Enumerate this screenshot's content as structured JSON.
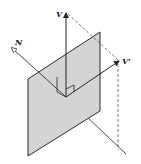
{
  "diagram": {
    "labels": {
      "v": "V",
      "n": "N",
      "v_prime": "V'"
    },
    "colors": {
      "plane_fill": "#d4d4d4",
      "line": "#2a2a2a",
      "background": "#ffffff"
    }
  }
}
